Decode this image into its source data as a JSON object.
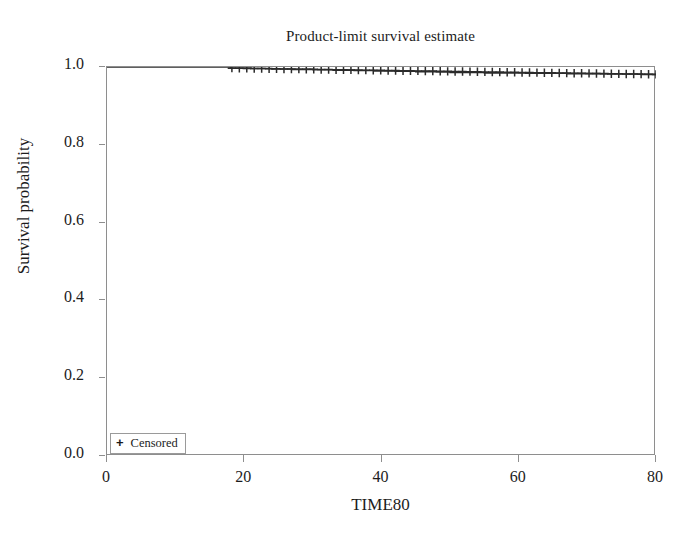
{
  "chart_data": {
    "type": "line",
    "title": "Product-limit survival estimate",
    "xlabel": "TIME80",
    "ylabel": "Survival probability",
    "xlim": [
      0,
      80
    ],
    "ylim": [
      0.0,
      1.0
    ],
    "grid": false,
    "legend_position": "bottom-left",
    "x_ticks": [
      {
        "value": 0,
        "label": "0"
      },
      {
        "value": 20,
        "label": "20"
      },
      {
        "value": 40,
        "label": "40"
      },
      {
        "value": 60,
        "label": "60"
      },
      {
        "value": 80,
        "label": "80"
      }
    ],
    "y_ticks": [
      {
        "value": 1.0,
        "label": "1.0"
      },
      {
        "value": 0.8,
        "label": "0.8"
      },
      {
        "value": 0.6,
        "label": "0.6"
      },
      {
        "value": 0.4,
        "label": "0.4"
      },
      {
        "value": 0.2,
        "label": "0.2"
      },
      {
        "value": 0.0,
        "label": "0.0"
      }
    ],
    "legend": [
      {
        "marker": "plus-marker",
        "label": "Censored"
      }
    ],
    "series": [
      {
        "name": "Survival function",
        "type": "step",
        "color": "#2b2b2b",
        "x": [
          0,
          2,
          6,
          10,
          14,
          17,
          18,
          21,
          24,
          27,
          30,
          33,
          36,
          39,
          42,
          45,
          48,
          50,
          52,
          55,
          58,
          61,
          64,
          67,
          70,
          73,
          76,
          78,
          80
        ],
        "y": [
          1.0,
          1.0,
          1.0,
          1.0,
          1.0,
          1.0,
          0.997,
          0.996,
          0.995,
          0.994,
          0.993,
          0.992,
          0.991,
          0.99,
          0.989,
          0.988,
          0.987,
          0.986,
          0.986,
          0.985,
          0.985,
          0.984,
          0.984,
          0.983,
          0.983,
          0.982,
          0.982,
          0.981,
          0.981
        ]
      }
    ],
    "censored_points": {
      "name": "Censored",
      "marker": "plus",
      "color": "#2b2b2b",
      "x_start": 18.2,
      "x_end": 80.0,
      "count": 58,
      "y_start": 0.997,
      "y_end": 0.981
    }
  }
}
